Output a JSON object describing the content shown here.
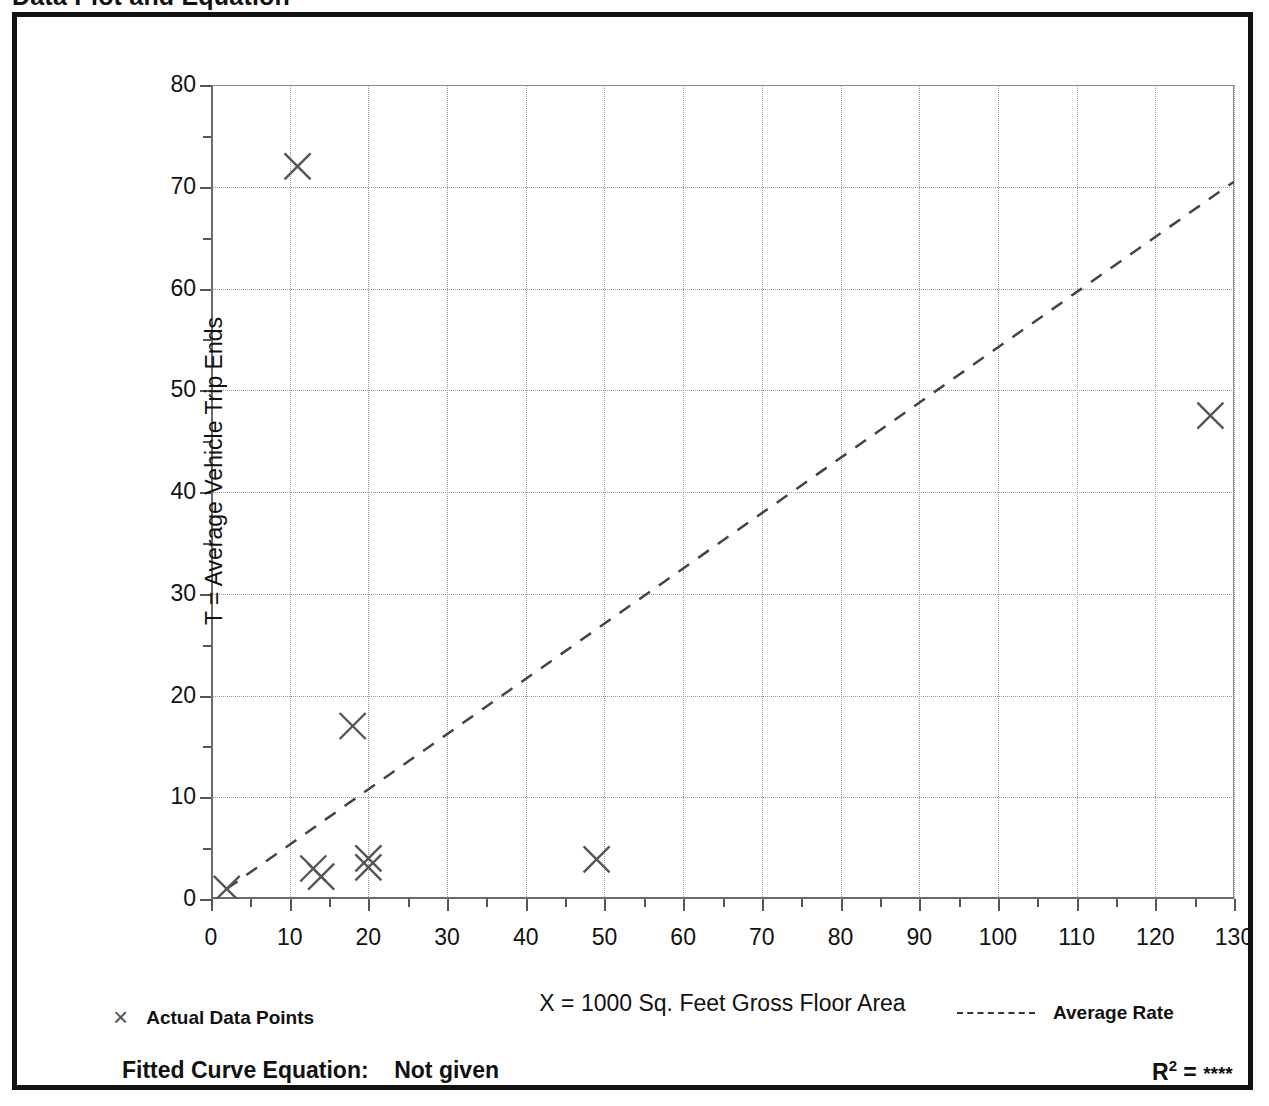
{
  "page": {
    "title": "Data Plot and Equation"
  },
  "chart_data": {
    "type": "scatter",
    "title": "Data Plot and Equation",
    "xlabel": "X = 1000 Sq. Feet Gross Floor Area",
    "ylabel": "T = Average Vehicle Trip Ends",
    "xlim": [
      0,
      130
    ],
    "ylim": [
      0,
      80
    ],
    "xticks": [
      0,
      10,
      20,
      30,
      40,
      50,
      60,
      70,
      80,
      90,
      100,
      110,
      120,
      130
    ],
    "yticks": [
      0,
      10,
      20,
      30,
      40,
      50,
      60,
      70,
      80
    ],
    "xminor_step": 5,
    "yminor_step": 5,
    "grid": true,
    "grid_style": "dotted",
    "grid_color": "#9a9a9a",
    "marker": "x",
    "marker_color": "#555555",
    "points": [
      {
        "x": 2,
        "y": 1.0
      },
      {
        "x": 11,
        "y": 72.0
      },
      {
        "x": 13,
        "y": 3.0
      },
      {
        "x": 14,
        "y": 2.2
      },
      {
        "x": 18,
        "y": 17.0
      },
      {
        "x": 20,
        "y": 4.0
      },
      {
        "x": 20,
        "y": 3.1
      },
      {
        "x": 49,
        "y": 3.9
      },
      {
        "x": 127,
        "y": 47.5
      }
    ],
    "series": [
      {
        "name": "Actual Data Points",
        "type": "scatter",
        "x": [
          2,
          11,
          13,
          14,
          18,
          20,
          20,
          49,
          127
        ],
        "values": [
          1.0,
          72.0,
          3.0,
          2.2,
          17.0,
          4.0,
          3.1,
          3.9,
          47.5
        ]
      },
      {
        "name": "Average Rate",
        "type": "line",
        "style": "dashed",
        "x": [
          2,
          130
        ],
        "values": [
          1.0,
          70.5
        ]
      }
    ],
    "legend_position": "below-plot",
    "annotations": {
      "fitted_curve_label": "Fitted Curve Equation:",
      "fitted_curve_value": "Not given",
      "r_squared_label": "R",
      "r_squared_exponent": "2",
      "r_squared_equals": "=",
      "r_squared_value": "****"
    }
  },
  "legend": {
    "data_points_label": "Actual Data Points",
    "average_rate_label": "Average Rate",
    "marker_glyph": "×"
  },
  "footer": {
    "equation_label": "Fitted Curve Equation:",
    "equation_value": "Not given",
    "rsq_base": "R",
    "rsq_exp": "2",
    "rsq_eq": " = ",
    "rsq_value": "****"
  }
}
